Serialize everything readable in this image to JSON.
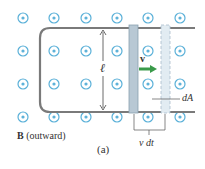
{
  "diagram": {
    "field_label_symbol": "B",
    "field_label_text": "(outward)",
    "length_label": "ℓ",
    "velocity_label": "v",
    "area_label": "dA",
    "displacement_label": "v dt",
    "caption": "(a)",
    "colors": {
      "dot_circle": "#5ab0d8",
      "rail": "#7a7a7a",
      "rod": "#b8c8d4",
      "rod_ghost": "#e2ecf2",
      "arrow": "#3a9a4a"
    }
  }
}
